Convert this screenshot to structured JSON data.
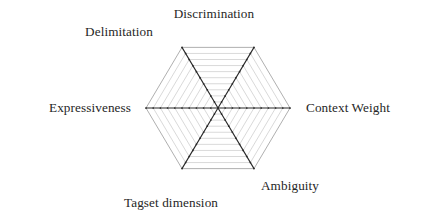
{
  "figure": {
    "background_color": "#ffffff",
    "width": 424,
    "height": 217
  },
  "chart_data": {
    "type": "radar",
    "title": "",
    "subtitle": "",
    "xlabel": "",
    "ylabel": "",
    "grid": true,
    "legend": false,
    "legend_position": "none",
    "axis_count": 6,
    "grid_rings": 10,
    "rmin": 0,
    "rmax": 10,
    "series": [],
    "note": "Empty radar/spider grid template with six labelled axes and no plotted data series.",
    "categories": [
      "Discrimination",
      "Context Weight",
      "Ambiguity",
      "Tagset dimension",
      "Expressiveness",
      "Delimitation"
    ],
    "axes": [
      {
        "id": "discrimination",
        "label": "Discrimination",
        "angle_deg": 60,
        "label_anchor": "middle",
        "label_x": 214,
        "label_y": 18
      },
      {
        "id": "context-weight",
        "label": "Context Weight",
        "angle_deg": 0,
        "label_anchor": "start",
        "label_x": 306,
        "label_y": 112
      },
      {
        "id": "ambiguity",
        "label": "Ambiguity",
        "angle_deg": -60,
        "label_anchor": "start",
        "label_x": 261,
        "label_y": 190
      },
      {
        "id": "tagset-dimension",
        "label": "Tagset dimension",
        "angle_deg": -120,
        "label_anchor": "middle",
        "label_x": 171,
        "label_y": 207
      },
      {
        "id": "expressiveness",
        "label": "Expressiveness",
        "angle_deg": 180,
        "label_anchor": "end",
        "label_x": 131,
        "label_y": 112
      },
      {
        "id": "delimitation",
        "label": "Delimitation",
        "angle_deg": 120,
        "label_anchor": "middle",
        "label_x": 119,
        "label_y": 36
      }
    ],
    "colors": {
      "grid_line": "#b9b9b9",
      "outer_ring": "#8c8c8c",
      "spoke": "#2b2b2b",
      "text": "#262626",
      "background": "#ffffff"
    },
    "geometry": {
      "center_x": 218,
      "center_y": 108,
      "radius_x": 72,
      "radius_y": 70,
      "orientation": "flat-top",
      "vertices": [
        {
          "axis": "context-weight",
          "x": 290,
          "y": 108
        },
        {
          "axis": "discrimination",
          "x": 254,
          "y": 38
        },
        {
          "axis": "delimitation",
          "x": 182,
          "y": 38
        },
        {
          "axis": "expressiveness",
          "x": 146,
          "y": 108
        },
        {
          "axis": "tagset-dimension",
          "x": 182,
          "y": 178
        },
        {
          "axis": "ambiguity",
          "x": 254,
          "y": 178
        }
      ]
    }
  }
}
